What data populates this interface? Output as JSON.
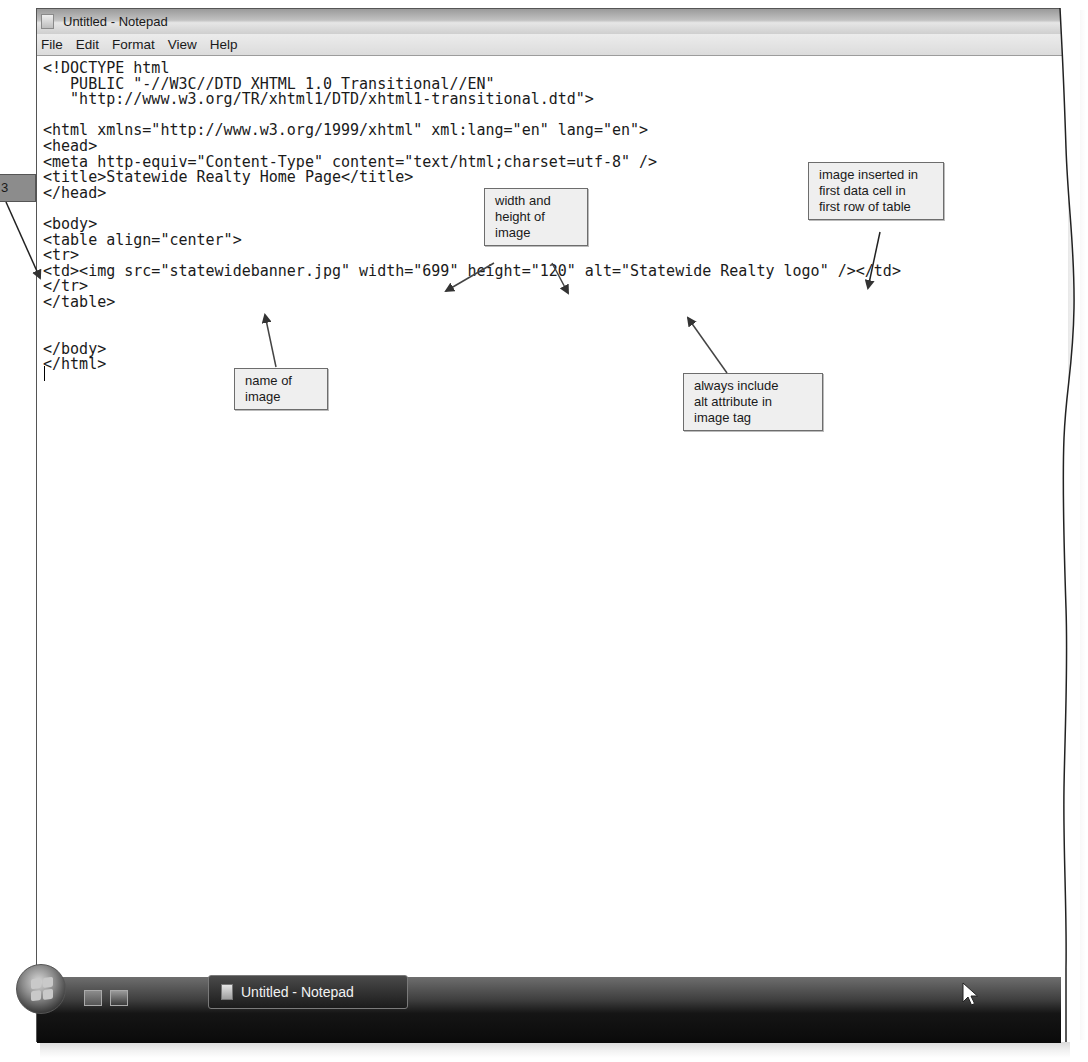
{
  "window": {
    "title": "Untitled - Notepad"
  },
  "menubar": {
    "items": [
      {
        "label": "File"
      },
      {
        "label": "Edit"
      },
      {
        "label": "Format"
      },
      {
        "label": "View"
      },
      {
        "label": "Help"
      }
    ]
  },
  "editor": {
    "lines": [
      "<!DOCTYPE html",
      "   PUBLIC \"-//W3C//DTD XHTML 1.0 Transitional//EN\"",
      "   \"http://www.w3.org/TR/xhtml1/DTD/xhtml1-transitional.dtd\">",
      "",
      "<html xmlns=\"http://www.w3.org/1999/xhtml\" xml:lang=\"en\" lang=\"en\">",
      "<head>",
      "<meta http-equiv=\"Content-Type\" content=\"text/html;charset=utf-8\" />",
      "<title>Statewide Realty Home Page</title>",
      "</head>",
      "",
      "<body>",
      "<table align=\"center\">",
      "<tr>",
      "<td><img src=\"statewidebanner.jpg\" width=\"699\" height=\"120\" alt=\"Statewide Realty logo\" /></td>",
      "</tr>",
      "</table>",
      "",
      "",
      "</body>",
      "</html>"
    ]
  },
  "callouts": {
    "step": "3",
    "width_height": [
      "width and",
      "height of",
      "image"
    ],
    "image_inserted": [
      "image inserted in",
      "first data cell in",
      "first row of table"
    ],
    "name_of_image": [
      "name of",
      "image"
    ],
    "alt_attribute": [
      "always include",
      "alt attribute in",
      "image tag"
    ]
  },
  "taskbar": {
    "start_button": "start-orb",
    "quick_launch": [
      "show-desktop",
      "switch-windows"
    ],
    "tasks": [
      {
        "label": "Untitled - Notepad"
      }
    ]
  }
}
